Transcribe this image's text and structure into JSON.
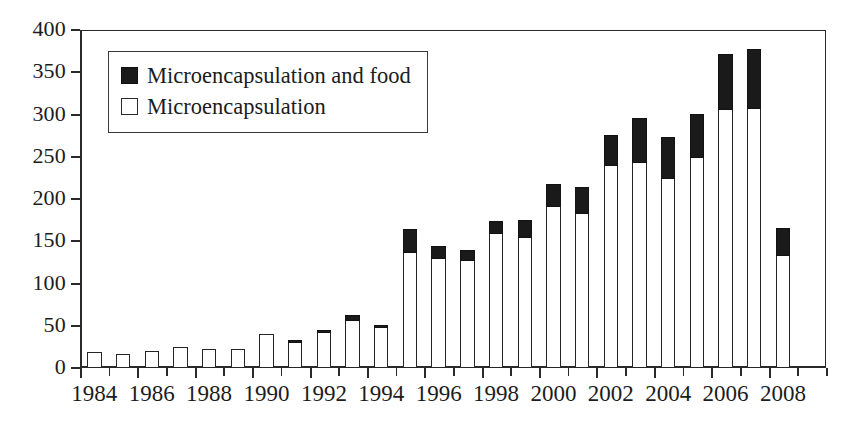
{
  "chart_data": {
    "type": "bar",
    "title": "",
    "subtitle": "",
    "xlabel": "",
    "ylabel": "",
    "stacked": true,
    "grid": false,
    "legend_position": "top-left",
    "ylim": [
      0,
      400
    ],
    "yticks": [
      0,
      50,
      100,
      150,
      200,
      250,
      300,
      350,
      400
    ],
    "ytick_labels": [
      "0",
      "50",
      "100",
      "150",
      "200",
      "250",
      "300",
      "350",
      "400"
    ],
    "xlim": [
      1983.5,
      2009.5
    ],
    "categories": [
      "1984",
      "1985",
      "1986",
      "1987",
      "1988",
      "1989",
      "1990",
      "1991",
      "1992",
      "1993",
      "1994",
      "1995",
      "1996",
      "1997",
      "1998",
      "1999",
      "2000",
      "2001",
      "2002",
      "2003",
      "2004",
      "2005",
      "2006",
      "2007",
      "2008"
    ],
    "xtick_labels": [
      "1984",
      "1986",
      "1988",
      "1990",
      "1992",
      "1994",
      "1996",
      "1998",
      "2000",
      "2002",
      "2004",
      "2006",
      "2008"
    ],
    "series": [
      {
        "name": "Microencapsulation",
        "color": "#ffffff",
        "edge_color": "#262626",
        "values": [
          19,
          17,
          20,
          25,
          23,
          23,
          40,
          31,
          43,
          57,
          49,
          138,
          131,
          129,
          161,
          156,
          193,
          184,
          241,
          245,
          226,
          250,
          307,
          308,
          135
        ]
      },
      {
        "name": "Microencapsulation and food",
        "color": "#1a1a1a",
        "edge_color": "#121212",
        "values": [
          0,
          0,
          0,
          0,
          0,
          0,
          0,
          4,
          4,
          8,
          4,
          28,
          15,
          12,
          15,
          21,
          27,
          32,
          37,
          53,
          49,
          53,
          66,
          72,
          33
        ]
      }
    ],
    "totals": [
      19,
      17,
      20,
      25,
      23,
      23,
      40,
      35,
      47,
      65,
      53,
      166,
      146,
      141,
      176,
      177,
      220,
      216,
      278,
      298,
      275,
      303,
      373,
      380,
      168
    ]
  },
  "legend": {
    "entries": [
      {
        "label": "Microencapsulation and food",
        "swatch": "filled-square-icon"
      },
      {
        "label": "Microencapsulation",
        "swatch": "hollow-square-icon"
      }
    ]
  }
}
